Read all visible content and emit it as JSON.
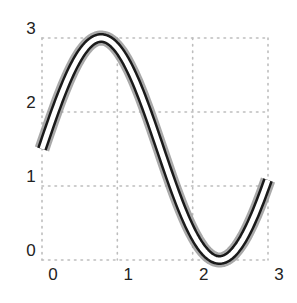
{
  "chart_data": {
    "type": "line",
    "title": "",
    "xlabel": "",
    "ylabel": "",
    "xlim": [
      0,
      3
    ],
    "ylim": [
      0,
      3
    ],
    "grid": true,
    "grid_style": "dotted",
    "legend": null,
    "x_ticks": [
      "0",
      "1",
      "2",
      "3"
    ],
    "y_ticks": [
      "0",
      "1",
      "2",
      "3"
    ],
    "series": [
      {
        "name": "y = 1.5 + 1.5·sin(2x)",
        "style": "triple stroke: gray halo, black outline, white core",
        "x": [
          0,
          0.25,
          0.5,
          0.785,
          1.0,
          1.25,
          1.5,
          1.75,
          2.0,
          2.356,
          2.5,
          2.75,
          3.0
        ],
        "y": [
          1.5,
          2.22,
          2.76,
          3.0,
          2.86,
          2.3,
          1.71,
          0.97,
          0.36,
          0.0,
          0.03,
          0.42,
          1.08
        ]
      }
    ],
    "colors": {
      "halo": "#9a9a9a",
      "outline": "#1a1a1a",
      "core": "#ffffff",
      "grid": "#bdbdbd"
    }
  }
}
